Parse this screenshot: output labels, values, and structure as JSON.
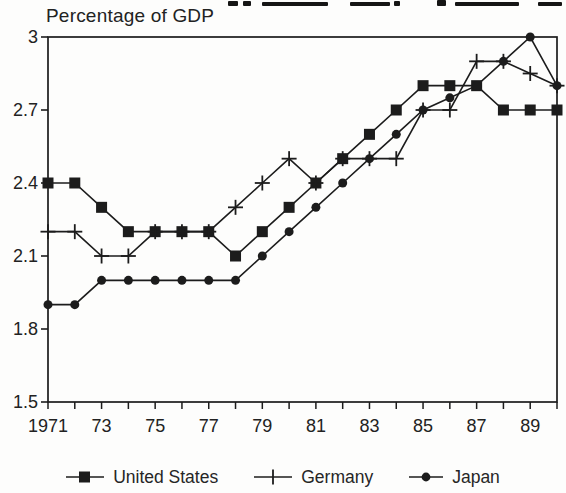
{
  "colors": {
    "ink": "#1c1c1c",
    "background": "#fdfdfc"
  },
  "chart_data": {
    "type": "line",
    "title_note": "",
    "ylabel": "Percentage of GDP",
    "xlabel": "",
    "grid": false,
    "legend_position": "bottom",
    "xlim": [
      1971,
      1990
    ],
    "ylim": [
      1.5,
      3
    ],
    "x": [
      1971,
      1972,
      1973,
      1974,
      1975,
      1976,
      1977,
      1978,
      1979,
      1980,
      1981,
      1982,
      1983,
      1984,
      1985,
      1986,
      1987,
      1988,
      1989,
      1990
    ],
    "x_tick_labels": [
      "1971",
      "",
      "73",
      "",
      "75",
      "",
      "77",
      "",
      "79",
      "",
      "81",
      "",
      "83",
      "",
      "85",
      "",
      "87",
      "",
      "89",
      ""
    ],
    "y_ticks": [
      1.5,
      1.8,
      2.1,
      2.4,
      2.7,
      3
    ],
    "y_tick_labels": [
      "1.5",
      "1.8",
      "2.1",
      "2.4",
      "2.7",
      "3"
    ],
    "series": [
      {
        "name": "United States",
        "marker": "square",
        "values": [
          2.4,
          2.4,
          2.3,
          2.2,
          2.2,
          2.2,
          2.2,
          2.1,
          2.2,
          2.3,
          2.4,
          2.5,
          2.6,
          2.7,
          2.8,
          2.8,
          2.8,
          2.7,
          2.7,
          2.7
        ]
      },
      {
        "name": "Germany",
        "marker": "plus",
        "values": [
          2.2,
          2.2,
          2.1,
          2.1,
          2.2,
          2.2,
          2.2,
          2.3,
          2.4,
          2.5,
          2.4,
          2.5,
          2.5,
          2.5,
          2.7,
          2.7,
          2.9,
          2.9,
          2.85,
          2.8
        ]
      },
      {
        "name": "Japan",
        "marker": "circle",
        "values": [
          1.9,
          1.9,
          2.0,
          2.0,
          2.0,
          2.0,
          2.0,
          2.0,
          2.1,
          2.2,
          2.3,
          2.4,
          2.5,
          2.6,
          2.7,
          2.75,
          2.8,
          2.9,
          3.0,
          2.8
        ]
      }
    ]
  }
}
